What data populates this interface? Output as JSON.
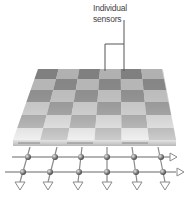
{
  "diagram": {
    "title_label": {
      "line1": "Individual",
      "line2": "sensors"
    },
    "sensor_board": {
      "rows": 6,
      "columns": 6,
      "cell_colors": [
        "#8e8e8e",
        "#c6c6c6"
      ],
      "surface_top_shade": "#9a9a9a",
      "surface_bottom_shade": "#e6e6e6",
      "edge_color": "#d0d0d0"
    },
    "readout_grid": {
      "horizontal_lines": 2,
      "vertical_lines": 6,
      "node_shape": "sphere",
      "output_arrows_down": 6,
      "output_arrows_right": 2,
      "line_color": "#8a8a8a",
      "node_color": "#777777"
    },
    "callout": {
      "points_to": "two-adjacent-sensors",
      "line_color": "#555555"
    }
  }
}
